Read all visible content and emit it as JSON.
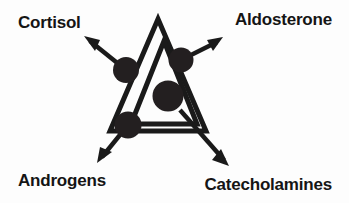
{
  "diagram": {
    "type": "concept-diagram",
    "background_color": "#fdfdfd",
    "stroke_color": "#1a1a1a",
    "fill_color": "#231f20",
    "labels": {
      "cortisol": "Cortisol",
      "aldosterone": "Aldosterone",
      "androgens": "Androgens",
      "catecholamines": "Catecholamines"
    },
    "shapes": {
      "outer_triangle": "outer-triangle",
      "inner_triangle": "inner-triangle",
      "nodes": [
        {
          "name": "node-cortisol",
          "cx": 126,
          "cy": 70,
          "r": 13
        },
        {
          "name": "node-aldosterone",
          "cx": 181,
          "cy": 60,
          "r": 12.5
        },
        {
          "name": "node-catecholamines",
          "cx": 168,
          "cy": 96,
          "r": 15.5
        },
        {
          "name": "node-androgens",
          "cx": 128,
          "cy": 125,
          "r": 13.5
        }
      ],
      "arrows": [
        {
          "name": "arrow-cortisol",
          "from": [
            126,
            70
          ],
          "to": [
            84,
            36
          ]
        },
        {
          "name": "arrow-aldosterone",
          "from": [
            181,
            60
          ],
          "to": [
            223,
            37
          ]
        },
        {
          "name": "arrow-androgens",
          "from": [
            128,
            125
          ],
          "to": [
            97,
            163
          ]
        },
        {
          "name": "arrow-catecholamines",
          "from": [
            182,
            112
          ],
          "to": [
            229,
            166
          ]
        }
      ]
    }
  }
}
